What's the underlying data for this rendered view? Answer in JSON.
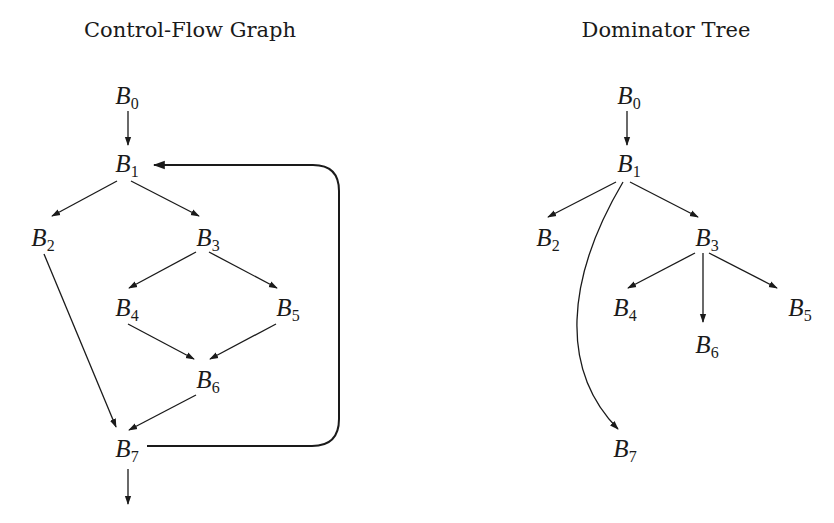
{
  "panels": [
    {
      "id": "cfg",
      "title": "Control-Flow Graph",
      "title_x": 190,
      "nodes": [
        {
          "id": "B0",
          "letter": "B",
          "sub": "0",
          "x": 127,
          "y": 97
        },
        {
          "id": "B1",
          "letter": "B",
          "sub": "1",
          "x": 127,
          "y": 165
        },
        {
          "id": "B2",
          "letter": "B",
          "sub": "2",
          "x": 43,
          "y": 239
        },
        {
          "id": "B3",
          "letter": "B",
          "sub": "3",
          "x": 208,
          "y": 239
        },
        {
          "id": "B4",
          "letter": "B",
          "sub": "4",
          "x": 127,
          "y": 309
        },
        {
          "id": "B5",
          "letter": "B",
          "sub": "5",
          "x": 288,
          "y": 309
        },
        {
          "id": "B6",
          "letter": "B",
          "sub": "6",
          "x": 208,
          "y": 381
        },
        {
          "id": "B7",
          "letter": "B",
          "sub": "7",
          "x": 127,
          "y": 450
        }
      ],
      "edges": [
        {
          "from": "B0",
          "to": "B1"
        },
        {
          "from": "B1",
          "to": "B2"
        },
        {
          "from": "B1",
          "to": "B3"
        },
        {
          "from": "B2",
          "to": "B7"
        },
        {
          "from": "B3",
          "to": "B4"
        },
        {
          "from": "B3",
          "to": "B5"
        },
        {
          "from": "B4",
          "to": "B6"
        },
        {
          "from": "B5",
          "to": "B6"
        },
        {
          "from": "B6",
          "to": "B7"
        },
        {
          "from": "B7",
          "to": "B1",
          "kind": "back-edge"
        },
        {
          "from": "B7",
          "to": "exit"
        }
      ]
    },
    {
      "id": "domtree",
      "title": "Dominator Tree",
      "title_x": 666,
      "nodes": [
        {
          "id": "B0",
          "letter": "B",
          "sub": "0",
          "x": 629,
          "y": 97
        },
        {
          "id": "B1",
          "letter": "B",
          "sub": "1",
          "x": 629,
          "y": 165
        },
        {
          "id": "B2",
          "letter": "B",
          "sub": "2",
          "x": 548,
          "y": 239
        },
        {
          "id": "B3",
          "letter": "B",
          "sub": "3",
          "x": 707,
          "y": 239
        },
        {
          "id": "B4",
          "letter": "B",
          "sub": "4",
          "x": 625,
          "y": 309
        },
        {
          "id": "B5",
          "letter": "B",
          "sub": "5",
          "x": 800,
          "y": 309
        },
        {
          "id": "B6",
          "letter": "B",
          "sub": "6",
          "x": 707,
          "y": 346
        },
        {
          "id": "B7",
          "letter": "B",
          "sub": "7",
          "x": 625,
          "y": 450
        }
      ],
      "edges": [
        {
          "from": "B0",
          "to": "B1"
        },
        {
          "from": "B1",
          "to": "B2"
        },
        {
          "from": "B1",
          "to": "B3"
        },
        {
          "from": "B1",
          "to": "B7",
          "kind": "curved"
        },
        {
          "from": "B3",
          "to": "B4"
        },
        {
          "from": "B3",
          "to": "B6"
        },
        {
          "from": "B3",
          "to": "B5"
        }
      ]
    }
  ],
  "colors": {
    "ink": "#1a1a1a",
    "background": "#ffffff"
  }
}
